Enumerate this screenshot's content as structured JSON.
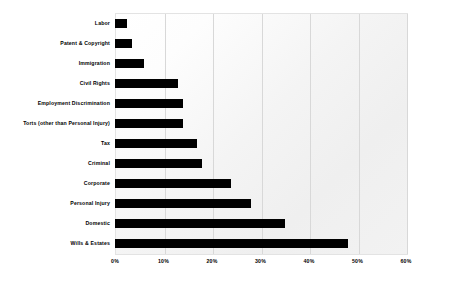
{
  "chart_data": {
    "type": "bar",
    "orientation": "horizontal",
    "title": "",
    "subtitle": "",
    "xlabel": "",
    "ylabel": "",
    "xlim": [
      0,
      60
    ],
    "ylim": null,
    "grid": true,
    "grid_axis": "x",
    "legend": null,
    "legend_position": "none",
    "bar_color": "#000000",
    "plot_background": "#f2f2f2",
    "page_background": "#ffffff",
    "gridline_color": "#d8d8d8",
    "value_suffix": "%",
    "categories": [
      "Labor",
      "Patent & Copyright",
      "Immigration",
      "Civil Rights",
      "Employment Discrimination",
      "Torts (other than Personal Injury)",
      "Tax",
      "Criminal",
      "Corporate",
      "Personal Injury",
      "Domestic",
      "Wills & Estates"
    ],
    "values": [
      2.5,
      3.5,
      6,
      13,
      14,
      14,
      17,
      18,
      24,
      28,
      35,
      48
    ],
    "xticks": [
      0,
      10,
      20,
      30,
      40,
      50,
      60
    ],
    "xticklabels": [
      "0%",
      "10%",
      "20%",
      "30%",
      "40%",
      "50%",
      "60%"
    ]
  }
}
